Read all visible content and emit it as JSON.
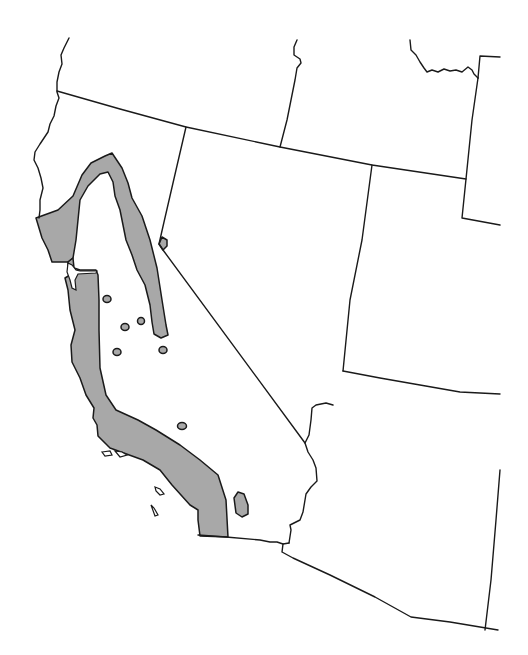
{
  "map": {
    "type": "species range map",
    "region": "Western United States (California, Nevada, Oregon, Idaho, Utah, Arizona)",
    "colors": {
      "background": "#ffffff",
      "border": "#1a1a1a",
      "range_fill": "#a8a8a8"
    },
    "borders": [
      {
        "name": "west-coast-north",
        "d": "M69,38 L64,48 L61,55 L62,64 L59,72 L57,82 L57,92 L59,98 L56,106 L54,116 L50,124 L48,132 L40,144 L35,152 L34,160 L38,168 L41,178 L43,188 L40,200 L40,210 L39,218"
      },
      {
        "name": "oregon-california-border",
        "d": "M57,91 L120,109 L186,127 L280,147 L372,165 L466,179"
      },
      {
        "name": "idaho-oregon-border",
        "d": "M297,40 L294,47 L294,55 L300,59 L301,63 L297,68 L295,80 L291,100 L287,120 L280,147"
      },
      {
        "name": "montana-idaho-border",
        "d": "M410,40 L411,50 L416,55 L420,62 L424,68 L427,72 L432,70 L438,72 L444,69 L450,71 L456,70 L462,72 L468,67 L472,70 L474,74 L478,78"
      },
      {
        "name": "wyoming-border",
        "d": "M478,78 L480,56 L500,57"
      },
      {
        "name": "idaho-utah-east-border",
        "d": "M478,78 L472,120 L466,179 L462,218 L500,225"
      },
      {
        "name": "california-nevada-border",
        "d": "M186,127 L176,170 L164,222 L159,244 L163,250 L305,443"
      },
      {
        "name": "nevada-utah-border",
        "d": "M372,165 L362,240 L350,300 L343,371"
      },
      {
        "name": "utah-arizona-border",
        "d": "M343,371 L380,378 L420,385 L460,392 L500,394"
      },
      {
        "name": "nevada-arizona-border",
        "d": "M333,405 L326,403 L316,405 L312,408 L311,420 L309,435 L305,443 L308,452 L313,460 L316,468 L317,481 L311,487 L306,494 L303,512 L300,520 L290,525 L291,530 L289,543"
      },
      {
        "name": "california-arizona-border",
        "d": "M289,543 L283,544 L277,542 L270,542 L260,540 L226,537 L198,535"
      },
      {
        "name": "arizona-mexico-border",
        "d": "M283,544 L282,552 L293,558 L330,575 L375,597 L411,617 L450,622 L498,630"
      },
      {
        "name": "arizona-newmexico-border",
        "d": "M500,470 L496,520 L491,580 L485,630"
      }
    ],
    "ranges": [
      {
        "name": "sierra-nevada-range-band",
        "d": "M36,218 L58,210 L73,196 L82,175 L91,163 L105,156 L112,153 L122,168 L128,183 L132,198 L142,216 L150,240 L157,268 L162,300 L166,325 L168,335 L161,338 L154,334 L152,322 L150,305 L145,285 L137,270 L132,255 L126,240 L123,225 L120,210 L115,196 L113,182 L108,172 L100,174 L88,186 L80,200 L78,220 L76,240 L73,258 L68,262 L52,262 L48,250 L42,238 Z"
      },
      {
        "name": "coast-range-band",
        "d": "M68,262 L73,258 L74,268 L80,270 L96,270 L98,275 L99,300 L99,330 L100,368 L106,395 L116,410 L138,420 L156,430 L180,445 L200,460 L218,475 L226,500 L228,537 L200,536 L198,520 L198,510 L190,505 L172,485 L160,470 L143,460 L110,448 L98,436 L97,425 L93,418 L94,408 L86,395 L80,378 L72,362 L71,345 L75,330 L70,310 L68,290 L65,278 L70,275 L68,268 Z"
      },
      {
        "name": "nevada-border-patch",
        "d": "M159,244 L162,237 L167,240 L167,246 L163,250 Z"
      },
      {
        "name": "peninsular-range-patch",
        "d": "M234,498 L238,492 L244,494 L248,505 L248,514 L242,517 L236,513 Z"
      }
    ],
    "islands": [
      {
        "name": "channel-island",
        "d": "M102,452 L110,451 L112,455 L105,456 Z"
      },
      {
        "name": "channel-island",
        "d": "M115,451 L122,452 L127,455 L120,457 Z"
      },
      {
        "name": "channel-island",
        "d": "M155,487 L160,489 L164,494 L160,495 L156,491 Z"
      },
      {
        "name": "channel-island",
        "d": "M151,505 L154,508 L158,515 L155,516 Z"
      },
      {
        "name": "sf-bay",
        "d": "M68,263 L72,265 L76,270 L80,271 L97,271 L96,273 L78,274 L75,280 L76,290 L72,288 L70,280 L67,272 Z"
      }
    ],
    "dots": [
      {
        "cx": 107,
        "cy": 299,
        "rx": 4,
        "ry": 3.5
      },
      {
        "cx": 125,
        "cy": 327,
        "rx": 4,
        "ry": 3.5
      },
      {
        "cx": 141,
        "cy": 321,
        "rx": 3.5,
        "ry": 3.5
      },
      {
        "cx": 117,
        "cy": 352,
        "rx": 4,
        "ry": 3.5
      },
      {
        "cx": 163,
        "cy": 350,
        "rx": 4,
        "ry": 3.5
      },
      {
        "cx": 182,
        "cy": 426,
        "rx": 4.5,
        "ry": 3.5
      }
    ]
  }
}
